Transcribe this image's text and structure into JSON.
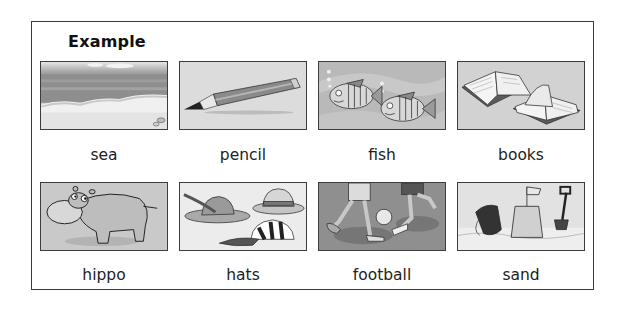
{
  "worksheet": {
    "title": "Example",
    "items": [
      {
        "label": "sea",
        "icon": "sea-beach-picture"
      },
      {
        "label": "pencil",
        "icon": "pencil-picture"
      },
      {
        "label": "fish",
        "icon": "fish-picture"
      },
      {
        "label": "books",
        "icon": "books-picture"
      },
      {
        "label": "hippo",
        "icon": "hippo-picture"
      },
      {
        "label": "hats",
        "icon": "hats-picture"
      },
      {
        "label": "football",
        "icon": "football-picture"
      },
      {
        "label": "sand",
        "icon": "sandcastle-picture"
      }
    ]
  },
  "colors": {
    "border": "#3a3a3a",
    "picture_background": "#cfcfcf",
    "text": "#222222"
  }
}
